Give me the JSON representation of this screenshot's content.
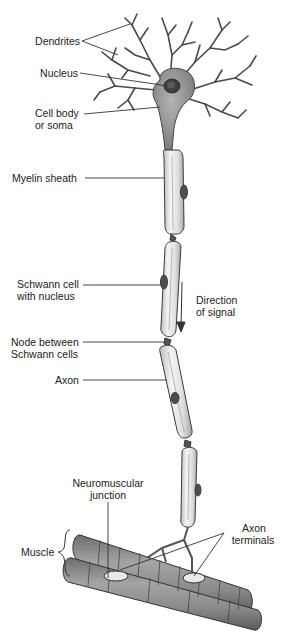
{
  "figure": {
    "colors": {
      "background": "#ffffff",
      "ink": "#222222",
      "soma_fill": "#9a9a9a",
      "nucleus_fill": "#444444",
      "myelin_fill": "#e6e6e6",
      "schwann_nucleus_fill": "#555555",
      "muscle_fill": "#8c8c8c"
    }
  },
  "labels": {
    "dendrites": "Dendrites",
    "nucleus": "Nucleus",
    "cell_body_line1": "Cell body",
    "cell_body_line2": "or soma",
    "myelin_sheath": "Myelin sheath",
    "schwann_cell_line1": "Schwann cell",
    "schwann_cell_line2": "with nucleus",
    "direction_line1": "Direction",
    "direction_line2": "of signal",
    "node_line1": "Node between",
    "node_line2": "Schwann cells",
    "axon": "Axon",
    "nmj_line1": "Neuromuscular",
    "nmj_line2": "junction",
    "muscle": "Muscle",
    "axon_terminals_line1": "Axon",
    "axon_terminals_line2": "terminals"
  }
}
